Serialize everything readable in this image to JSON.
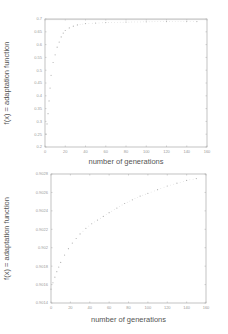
{
  "chart_data": [
    {
      "type": "scatter",
      "title": "",
      "xlabel": "number of generations",
      "ylabel": "f(x) = adaptation function",
      "xlim": [
        0,
        160
      ],
      "ylim": [
        0.2,
        0.7
      ],
      "x_ticks": [
        0,
        20,
        40,
        60,
        80,
        100,
        120,
        140,
        160
      ],
      "y_ticks": [
        0.2,
        0.25,
        0.3,
        0.35,
        0.4,
        0.45,
        0.5,
        0.55,
        0.6,
        0.65,
        0.7
      ],
      "x_tick_labels": [
        "0",
        "20",
        "40",
        "60",
        "80",
        "100",
        "120",
        "140",
        "160"
      ],
      "y_tick_labels": [
        "0.2",
        "0.25",
        "0.3",
        "0.35",
        "0.4",
        "0.45",
        "0.5",
        "0.55",
        "0.6",
        "0.65",
        "0.7"
      ],
      "grid": false,
      "legend": null,
      "series": [
        {
          "name": "best fitness",
          "x": [
            1,
            2,
            3,
            4,
            5,
            6,
            8,
            10,
            12,
            14,
            16,
            18,
            20,
            24,
            28,
            32,
            40,
            50,
            60,
            80,
            100,
            120,
            140,
            150
          ],
          "y": [
            0.25,
            0.29,
            0.33,
            0.38,
            0.43,
            0.48,
            0.53,
            0.56,
            0.59,
            0.61,
            0.63,
            0.645,
            0.655,
            0.665,
            0.672,
            0.677,
            0.682,
            0.684,
            0.686,
            0.688,
            0.689,
            0.69,
            0.69,
            0.69
          ]
        }
      ],
      "reference_line": {
        "y": 0.7
      }
    },
    {
      "type": "scatter",
      "title": "",
      "xlabel": "number of generations",
      "ylabel": "f(x) = adaptation function",
      "xlim": [
        0,
        160
      ],
      "ylim": [
        0.9014,
        0.9028
      ],
      "x_ticks": [
        0,
        20,
        40,
        60,
        80,
        100,
        120,
        140,
        160
      ],
      "y_ticks": [
        0.9014,
        0.9016,
        0.9018,
        0.902,
        0.9022,
        0.9024,
        0.9026,
        0.9028
      ],
      "x_tick_labels": [
        "0",
        "20",
        "40",
        "60",
        "80",
        "100",
        "120",
        "140",
        "160"
      ],
      "y_tick_labels": [
        "0.9014",
        "0.9016",
        "0.9018",
        "0.902",
        "0.9022",
        "0.9024",
        "0.9026",
        "0.9028"
      ],
      "grid": false,
      "legend": null,
      "series": [
        {
          "name": "best fitness",
          "x": [
            0,
            2,
            4,
            6,
            8,
            10,
            14,
            18,
            22,
            26,
            30,
            36,
            42,
            48,
            54,
            60,
            68,
            76,
            84,
            92,
            100,
            110,
            120,
            130,
            140,
            150
          ],
          "y": [
            0.90155,
            0.90162,
            0.90168,
            0.90174,
            0.90179,
            0.90184,
            0.90192,
            0.90199,
            0.90205,
            0.9021,
            0.90215,
            0.90221,
            0.90226,
            0.9023,
            0.90234,
            0.90238,
            0.90243,
            0.90248,
            0.90252,
            0.90256,
            0.90259,
            0.90263,
            0.90267,
            0.9027,
            0.90273,
            0.90275
          ]
        }
      ]
    }
  ]
}
